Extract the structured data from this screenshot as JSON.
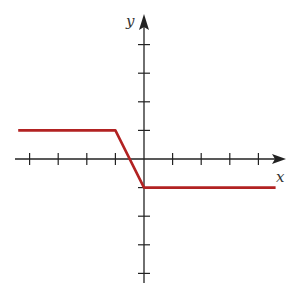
{
  "chart_data": {
    "type": "line",
    "title": "",
    "xlabel": "x",
    "ylabel": "y",
    "xlim": [
      -4.5,
      5
    ],
    "ylim": [
      -4.3,
      4.3
    ],
    "grid": false,
    "legend": null,
    "x_ticks": [
      -4,
      -3,
      -2,
      -1,
      1,
      2,
      3,
      4
    ],
    "y_ticks": [
      -4,
      -3,
      -2,
      -1,
      1,
      2,
      3,
      4
    ],
    "tick_labels_shown": false,
    "series": [
      {
        "name": "f(x)",
        "color": "#b22222",
        "x": [
          -4.4,
          -1,
          0,
          4.6
        ],
        "y": [
          1,
          1,
          -1,
          -1
        ]
      }
    ]
  },
  "labels": {
    "x_axis": "x",
    "y_axis": "y"
  },
  "colors": {
    "axis": "#222222",
    "curve": "#b22222"
  }
}
